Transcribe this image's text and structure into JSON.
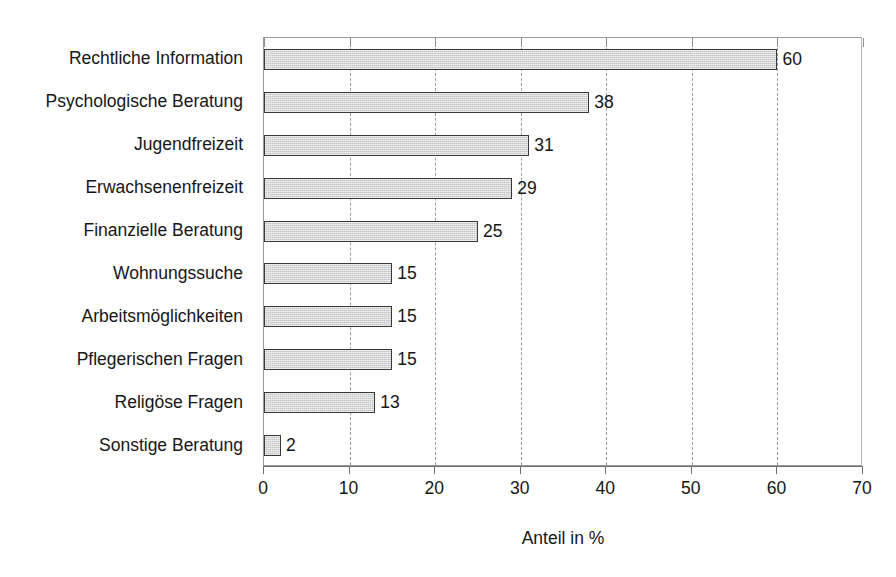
{
  "chart_data": {
    "type": "bar",
    "orientation": "horizontal",
    "title": "",
    "xlabel": "Anteil in %",
    "ylabel": "",
    "xlim": [
      0,
      70
    ],
    "xticks": [
      0,
      10,
      20,
      30,
      40,
      50,
      60,
      70
    ],
    "grid": "vertical-dashed",
    "legend": "none",
    "categories": [
      "Rechtliche Information",
      "Psychologische Beratung",
      "Jugendfreizeit",
      "Erwachsenenfreizeit",
      "Finanzielle Beratung",
      "Wohnungssuche",
      "Arbeitsmöglichkeiten",
      "Pflegerischen Fragen",
      "Religöse Fragen",
      "Sonstige Beratung"
    ],
    "values": [
      60,
      38,
      31,
      29,
      25,
      15,
      15,
      15,
      13,
      2
    ],
    "value_labels": [
      "60",
      "38",
      "31",
      "29",
      "25",
      "15",
      "15",
      "15",
      "13",
      "2"
    ],
    "tick_labels": [
      "0",
      "10",
      "20",
      "30",
      "40",
      "50",
      "60",
      "70"
    ],
    "colors": {
      "bar_fill": "#c4c4c4",
      "bar_border": "#3a3a3a",
      "gridline": "#9d9d9d",
      "axis": "#6f6f6f",
      "text": "#161616",
      "background": "#ffffff"
    }
  }
}
